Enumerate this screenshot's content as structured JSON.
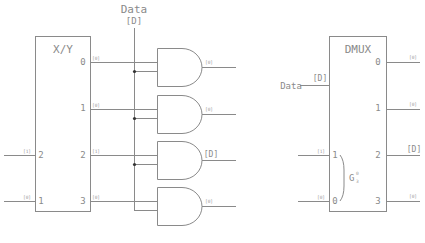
{
  "diagram": {
    "data_input": {
      "label": "Data",
      "bus": "[D]"
    },
    "xy_decoder": {
      "title": "X/Y",
      "inputs": [
        {
          "pin": "2",
          "value": "[1]"
        },
        {
          "pin": "1",
          "value": "[0]"
        }
      ],
      "outputs": [
        {
          "pin": "0",
          "value": "[0]"
        },
        {
          "pin": "1",
          "value": "[0]"
        },
        {
          "pin": "2",
          "value": "[1]"
        },
        {
          "pin": "3",
          "value": "[0]"
        }
      ]
    },
    "and_gates": [
      {
        "output": "[0]"
      },
      {
        "output": "[0]"
      },
      {
        "output": "[D]"
      },
      {
        "output": "[0]"
      }
    ],
    "dmux": {
      "title": "DMUX",
      "data_label": "Data",
      "data_value": "[D]",
      "select_inputs": [
        {
          "pin": "1",
          "value": "[1]"
        },
        {
          "pin": "0",
          "value": "[0]"
        }
      ],
      "group_label": "G",
      "group_sup": "0",
      "group_sub": "3",
      "outputs": [
        {
          "pin": "0",
          "value": "[0]"
        },
        {
          "pin": "1",
          "value": "[0]"
        },
        {
          "pin": "2",
          "value": "[D]"
        },
        {
          "pin": "3",
          "value": "[0]"
        }
      ]
    },
    "colors": {
      "line": "#8a8a8a",
      "junction": "#333333"
    }
  }
}
